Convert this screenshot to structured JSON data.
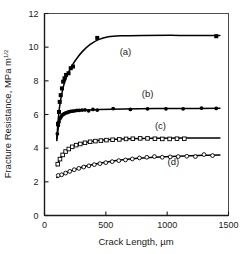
{
  "chart_data": {
    "type": "scatter",
    "title": "",
    "xlabel": "Crack Length, µm",
    "ylabel_main": "Fracture Resistance, MPa m",
    "ylabel_sup": "1/2",
    "xlim": [
      0,
      1500
    ],
    "ylim": [
      0,
      12
    ],
    "xticks": [
      0,
      500,
      1000,
      1500
    ],
    "yticks": [
      0,
      2,
      4,
      6,
      8,
      10,
      12
    ],
    "xtick_labels": [
      "0",
      "500",
      "1000",
      "1500"
    ],
    "ytick_labels": [
      "0",
      "2",
      "4",
      "6",
      "8",
      "10",
      "12"
    ],
    "grid": false,
    "legend_position": "inline-annotations",
    "series": [
      {
        "name": "(a)",
        "marker": "filled-square",
        "label_x": 660,
        "label_y": 9.55,
        "points": [
          {
            "x": 110,
            "y": 5.45
          },
          {
            "x": 118,
            "y": 6.15
          },
          {
            "x": 124,
            "y": 6.75
          },
          {
            "x": 132,
            "y": 7.15
          },
          {
            "x": 142,
            "y": 7.55
          },
          {
            "x": 152,
            "y": 7.95
          },
          {
            "x": 163,
            "y": 8.15
          },
          {
            "x": 176,
            "y": 8.35
          },
          {
            "x": 196,
            "y": 8.45
          },
          {
            "x": 214,
            "y": 8.75
          },
          {
            "x": 232,
            "y": 8.85
          },
          {
            "x": 430,
            "y": 10.55
          },
          {
            "x": 1400,
            "y": 10.65
          }
        ],
        "fit": [
          {
            "x": 100,
            "y": 4.55
          },
          {
            "x": 120,
            "y": 6.3
          },
          {
            "x": 150,
            "y": 7.55
          },
          {
            "x": 180,
            "y": 8.25
          },
          {
            "x": 220,
            "y": 8.85
          },
          {
            "x": 260,
            "y": 9.3
          },
          {
            "x": 310,
            "y": 9.75
          },
          {
            "x": 370,
            "y": 10.15
          },
          {
            "x": 440,
            "y": 10.45
          },
          {
            "x": 520,
            "y": 10.62
          },
          {
            "x": 620,
            "y": 10.68
          },
          {
            "x": 800,
            "y": 10.7
          },
          {
            "x": 1100,
            "y": 10.7
          },
          {
            "x": 1430,
            "y": 10.7
          }
        ]
      },
      {
        "name": "(b)",
        "marker": "filled-circle",
        "label_x": 840,
        "label_y": 7.05,
        "points": [
          {
            "x": 105,
            "y": 4.85
          },
          {
            "x": 112,
            "y": 5.35
          },
          {
            "x": 118,
            "y": 5.55
          },
          {
            "x": 126,
            "y": 5.75
          },
          {
            "x": 134,
            "y": 5.85
          },
          {
            "x": 142,
            "y": 5.95
          },
          {
            "x": 152,
            "y": 6.0
          },
          {
            "x": 162,
            "y": 6.05
          },
          {
            "x": 174,
            "y": 6.1
          },
          {
            "x": 186,
            "y": 6.12
          },
          {
            "x": 198,
            "y": 6.15
          },
          {
            "x": 212,
            "y": 6.18
          },
          {
            "x": 228,
            "y": 6.2
          },
          {
            "x": 246,
            "y": 6.22
          },
          {
            "x": 264,
            "y": 6.24
          },
          {
            "x": 284,
            "y": 6.25
          },
          {
            "x": 306,
            "y": 6.26
          },
          {
            "x": 330,
            "y": 6.27
          },
          {
            "x": 360,
            "y": 6.22
          },
          {
            "x": 395,
            "y": 6.3
          },
          {
            "x": 430,
            "y": 6.26
          },
          {
            "x": 560,
            "y": 6.35
          },
          {
            "x": 700,
            "y": 6.3
          },
          {
            "x": 840,
            "y": 6.34
          },
          {
            "x": 990,
            "y": 6.34
          },
          {
            "x": 1130,
            "y": 6.34
          },
          {
            "x": 1280,
            "y": 6.38
          },
          {
            "x": 1400,
            "y": 6.36
          }
        ],
        "fit": [
          {
            "x": 100,
            "y": 4.45
          },
          {
            "x": 120,
            "y": 5.55
          },
          {
            "x": 150,
            "y": 5.95
          },
          {
            "x": 190,
            "y": 6.12
          },
          {
            "x": 240,
            "y": 6.2
          },
          {
            "x": 320,
            "y": 6.26
          },
          {
            "x": 450,
            "y": 6.3
          },
          {
            "x": 650,
            "y": 6.33
          },
          {
            "x": 900,
            "y": 6.35
          },
          {
            "x": 1200,
            "y": 6.36
          },
          {
            "x": 1430,
            "y": 6.37
          }
        ]
      },
      {
        "name": "(c)",
        "marker": "open-square",
        "label_x": 945,
        "label_y": 5.15,
        "points": [
          {
            "x": 108,
            "y": 3.05
          },
          {
            "x": 126,
            "y": 3.35
          },
          {
            "x": 148,
            "y": 3.6
          },
          {
            "x": 172,
            "y": 3.8
          },
          {
            "x": 198,
            "y": 3.95
          },
          {
            "x": 226,
            "y": 4.08
          },
          {
            "x": 258,
            "y": 4.18
          },
          {
            "x": 292,
            "y": 4.25
          },
          {
            "x": 330,
            "y": 4.32
          },
          {
            "x": 372,
            "y": 4.38
          },
          {
            "x": 415,
            "y": 4.42
          },
          {
            "x": 460,
            "y": 4.45
          },
          {
            "x": 505,
            "y": 4.48
          },
          {
            "x": 555,
            "y": 4.5
          },
          {
            "x": 610,
            "y": 4.52
          },
          {
            "x": 665,
            "y": 4.55
          },
          {
            "x": 720,
            "y": 4.56
          },
          {
            "x": 780,
            "y": 4.58
          },
          {
            "x": 840,
            "y": 4.58
          },
          {
            "x": 900,
            "y": 4.56
          },
          {
            "x": 960,
            "y": 4.55
          },
          {
            "x": 1020,
            "y": 4.55
          },
          {
            "x": 1080,
            "y": 4.56
          },
          {
            "x": 1140,
            "y": 4.56
          }
        ],
        "fit": [
          {
            "x": 100,
            "y": 2.95
          },
          {
            "x": 130,
            "y": 3.42
          },
          {
            "x": 170,
            "y": 3.78
          },
          {
            "x": 220,
            "y": 4.05
          },
          {
            "x": 290,
            "y": 4.25
          },
          {
            "x": 380,
            "y": 4.4
          },
          {
            "x": 500,
            "y": 4.5
          },
          {
            "x": 680,
            "y": 4.56
          },
          {
            "x": 900,
            "y": 4.59
          },
          {
            "x": 1150,
            "y": 4.6
          },
          {
            "x": 1430,
            "y": 4.61
          }
        ]
      },
      {
        "name": "(d)",
        "marker": "open-circle",
        "label_x": 1050,
        "label_y": 3.0,
        "points": [
          {
            "x": 112,
            "y": 2.38
          },
          {
            "x": 140,
            "y": 2.42
          },
          {
            "x": 172,
            "y": 2.52
          },
          {
            "x": 206,
            "y": 2.62
          },
          {
            "x": 242,
            "y": 2.72
          },
          {
            "x": 280,
            "y": 2.8
          },
          {
            "x": 320,
            "y": 2.88
          },
          {
            "x": 362,
            "y": 2.95
          },
          {
            "x": 406,
            "y": 3.02
          },
          {
            "x": 452,
            "y": 3.08
          },
          {
            "x": 500,
            "y": 3.14
          },
          {
            "x": 552,
            "y": 3.2
          },
          {
            "x": 606,
            "y": 3.26
          },
          {
            "x": 660,
            "y": 3.3
          },
          {
            "x": 716,
            "y": 3.36
          },
          {
            "x": 774,
            "y": 3.42
          },
          {
            "x": 834,
            "y": 3.46
          },
          {
            "x": 896,
            "y": 3.5
          },
          {
            "x": 960,
            "y": 3.46
          },
          {
            "x": 1025,
            "y": 3.48
          },
          {
            "x": 1090,
            "y": 3.5
          },
          {
            "x": 1160,
            "y": 3.52
          },
          {
            "x": 1230,
            "y": 3.5
          },
          {
            "x": 1300,
            "y": 3.62
          },
          {
            "x": 1370,
            "y": 3.56
          }
        ],
        "fit": [
          {
            "x": 100,
            "y": 2.26
          },
          {
            "x": 160,
            "y": 2.48
          },
          {
            "x": 240,
            "y": 2.72
          },
          {
            "x": 340,
            "y": 2.94
          },
          {
            "x": 460,
            "y": 3.12
          },
          {
            "x": 600,
            "y": 3.28
          },
          {
            "x": 760,
            "y": 3.4
          },
          {
            "x": 940,
            "y": 3.48
          },
          {
            "x": 1140,
            "y": 3.54
          },
          {
            "x": 1300,
            "y": 3.58
          },
          {
            "x": 1430,
            "y": 3.6
          }
        ]
      }
    ]
  }
}
